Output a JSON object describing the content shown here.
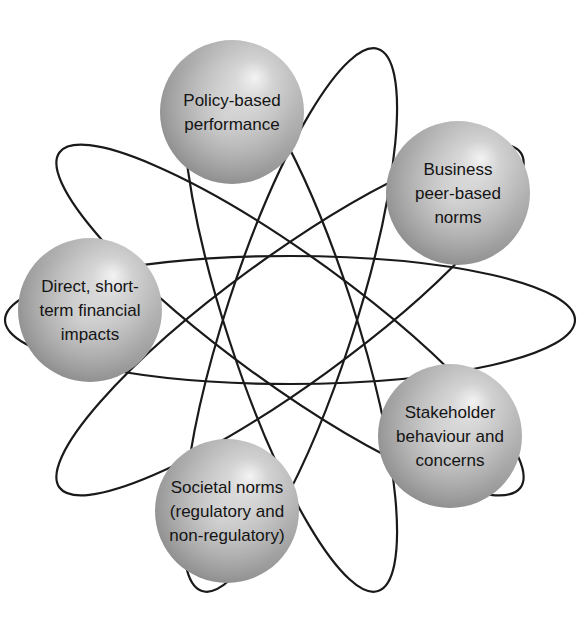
{
  "diagram": {
    "type": "atom-orbit",
    "center": {
      "x": 290,
      "y": 320
    },
    "colors": {
      "orbit_stroke": "#1a1a1a",
      "sphere_highlight": "#f2f2f2",
      "sphere_mid": "#b4b4b4",
      "sphere_edge": "#8a8a8a",
      "label_text": "#141414",
      "background": "#ffffff"
    },
    "orbits": [
      {
        "id": "orbit-1",
        "rx": 285,
        "ry": 64,
        "rotate": -72
      },
      {
        "id": "orbit-2",
        "rx": 285,
        "ry": 64,
        "rotate": -144
      },
      {
        "id": "orbit-3",
        "rx": 285,
        "ry": 64,
        "rotate": 144
      },
      {
        "id": "orbit-4",
        "rx": 285,
        "ry": 64,
        "rotate": 72
      },
      {
        "id": "orbit-5",
        "rx": 285,
        "ry": 64,
        "rotate": 0
      }
    ],
    "nodes": [
      {
        "id": "policy-based-performance",
        "cx": 232,
        "cy": 112,
        "r": 72,
        "lines": [
          "Policy-based",
          "performance"
        ]
      },
      {
        "id": "business-peer-based-norms",
        "cx": 458,
        "cy": 193,
        "r": 72,
        "lines": [
          "Business",
          "peer-based",
          "norms"
        ]
      },
      {
        "id": "direct-short-term-financial-impacts",
        "cx": 90,
        "cy": 310,
        "r": 72,
        "lines": [
          "Direct, short-",
          "term financial",
          "impacts"
        ]
      },
      {
        "id": "stakeholder-behaviour-and-concerns",
        "cx": 450,
        "cy": 436,
        "r": 72,
        "lines": [
          "Stakeholder",
          "behaviour and",
          "concerns"
        ]
      },
      {
        "id": "societal-norms",
        "cx": 227,
        "cy": 511,
        "r": 72,
        "lines": [
          "Societal norms",
          "(regulatory and",
          "non-regulatory)"
        ]
      }
    ]
  }
}
